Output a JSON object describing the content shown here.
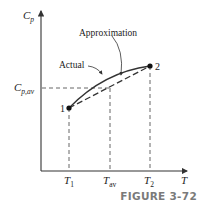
{
  "diagram": {
    "y_axis_label_main": "C",
    "y_axis_label_sub": "p",
    "x_axis_label": "T",
    "cp_av_label_main": "C",
    "cp_av_label_sub": "p,av",
    "x_ticks": [
      {
        "main": "T",
        "sub": "1"
      },
      {
        "main": "T",
        "sub": "av"
      },
      {
        "main": "T",
        "sub": "2"
      }
    ],
    "point_labels": [
      "1",
      "2"
    ],
    "annotations": {
      "approximation": "Approximation",
      "actual": "Actual"
    },
    "colors": {
      "lines": "#333333",
      "caption": "#7a7a7a"
    }
  },
  "caption": "FIGURE 3-72"
}
